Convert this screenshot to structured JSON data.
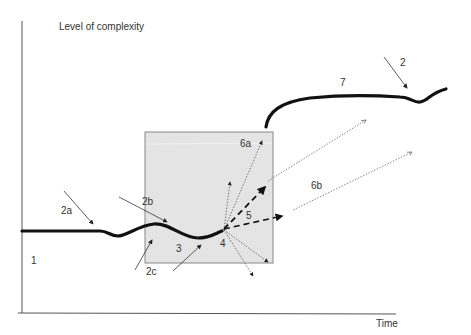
{
  "axes": {
    "y_label": "Level of complexity",
    "x_label": "Time"
  },
  "colors": {
    "axis": "#555555",
    "curve": "#111111",
    "box_fill": "#e4e4e4",
    "box_stroke": "#888888",
    "arrow": "#333333",
    "text": "#333333"
  },
  "labels": {
    "l1": "1",
    "l2": "2",
    "l2a": "2a",
    "l2b": "2b",
    "l2c": "2c",
    "l3": "3",
    "l4": "4",
    "l5": "5",
    "l6a": "6a",
    "l6b": "6b",
    "l7": "7"
  }
}
